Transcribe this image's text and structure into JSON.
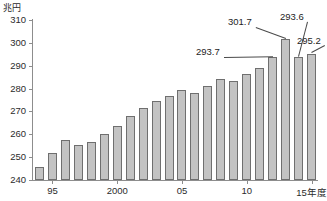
{
  "chart_data": {
    "type": "bar",
    "title": "",
    "unit_label": "兆円",
    "xlabel": "年度",
    "ylabel": "兆円",
    "ylim": [
      240,
      310
    ],
    "ytick_values": [
      240,
      250,
      260,
      270,
      280,
      290,
      300,
      310
    ],
    "ytick_labels": [
      "240",
      "250",
      "260",
      "270",
      "280",
      "290",
      "300",
      "310"
    ],
    "grid": false,
    "legend": false,
    "categories": [
      "94",
      "95",
      "96",
      "97",
      "98",
      "99",
      "2000",
      "01",
      "02",
      "03",
      "04",
      "05",
      "06",
      "07",
      "08",
      "09",
      "10",
      "11",
      "12",
      "13",
      "14",
      "15"
    ],
    "xtick_labels": [
      {
        "category": "95",
        "label": "95"
      },
      {
        "category": "2000",
        "label": "2000"
      },
      {
        "category": "05",
        "label": "05"
      },
      {
        "category": "10",
        "label": "10"
      },
      {
        "category": "15",
        "label": "15年度"
      }
    ],
    "values": [
      245.5,
      252.0,
      257.7,
      255.5,
      256.5,
      260.3,
      263.5,
      268.0,
      271.3,
      274.5,
      276.6,
      279.2,
      278.2,
      281.3,
      284.0,
      283.3,
      286.2,
      288.8,
      293.7,
      301.7,
      293.6,
      295.2
    ],
    "annotations": [
      {
        "category": "12",
        "value": 293.7,
        "text": "293.7"
      },
      {
        "category": "13",
        "value": 301.7,
        "text": "301.7"
      },
      {
        "category": "14",
        "value": 293.6,
        "text": "293.6"
      },
      {
        "category": "15",
        "value": 295.2,
        "text": "295.2"
      }
    ],
    "colors": {
      "bar_fill": "#c3c3c3",
      "bar_stroke": "#6f6f6f",
      "axis": "#8d8d8d",
      "text": "#2b2b2b",
      "background": "#ffffff"
    }
  }
}
